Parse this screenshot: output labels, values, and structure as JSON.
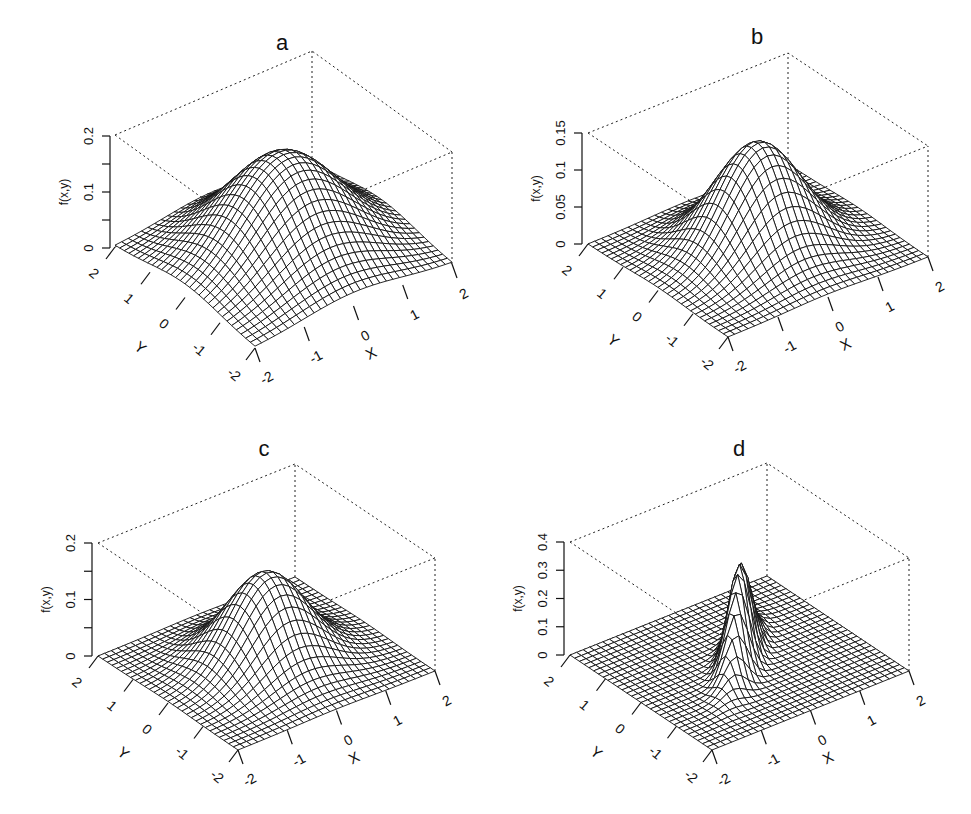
{
  "chart_data": [
    {
      "panel": "a",
      "type": "surface",
      "title": "a",
      "xlabel": "X",
      "ylabel": "Y",
      "zlabel": "f(x,y)",
      "xticks": [
        "-2",
        "-1",
        "0",
        "1",
        "2"
      ],
      "yticks": [
        "-2",
        "-1",
        "0",
        "1",
        "2"
      ],
      "zticks": [
        "0",
        "0.1",
        "0.2"
      ],
      "xlim": [
        -2,
        2
      ],
      "ylim": [
        -2,
        2
      ],
      "zlim": [
        0,
        0.2
      ],
      "surface": {
        "kind": "bivariate_normal",
        "mu": [
          0,
          0
        ],
        "sx": 1.0,
        "sy": 1.0,
        "rho": 0.0,
        "peak": 0.18
      },
      "grid": 30
    },
    {
      "panel": "b",
      "type": "surface",
      "title": "b",
      "xlabel": "X",
      "ylabel": "Y",
      "zlabel": "f(x,y)",
      "xticks": [
        "-2",
        "-1",
        "0",
        "1",
        "2"
      ],
      "yticks": [
        "-2",
        "-1",
        "0",
        "1",
        "2"
      ],
      "zticks": [
        "0",
        "0.05",
        "0.1",
        "0.15"
      ],
      "xlim": [
        -2,
        2
      ],
      "ylim": [
        -2,
        2
      ],
      "zlim": [
        0,
        0.15
      ],
      "surface": {
        "kind": "bivariate_normal",
        "mu": [
          0,
          0
        ],
        "sx": 0.75,
        "sy": 0.75,
        "rho": 0.0,
        "peak": 0.145
      },
      "grid": 30
    },
    {
      "panel": "c",
      "type": "surface",
      "title": "c",
      "xlabel": "X",
      "ylabel": "Y",
      "zlabel": "f(x,y)",
      "xticks": [
        "-2",
        "-1",
        "0",
        "1",
        "2"
      ],
      "yticks": [
        "-2",
        "-1",
        "0",
        "1",
        "2"
      ],
      "zticks": [
        "0",
        "0.1",
        "0.2"
      ],
      "xlim": [
        -2,
        2
      ],
      "ylim": [
        -2,
        2
      ],
      "zlim": [
        0,
        0.2
      ],
      "surface": {
        "kind": "bivariate_normal",
        "mu": [
          0,
          0
        ],
        "sx": 0.7,
        "sy": 0.7,
        "rho": 0.0,
        "peak": 0.16
      },
      "grid": 30
    },
    {
      "panel": "d",
      "type": "surface",
      "title": "d",
      "xlabel": "X",
      "ylabel": "Y",
      "zlabel": "f(x,y)",
      "xticks": [
        "-2",
        "-1",
        "0",
        "1",
        "2"
      ],
      "yticks": [
        "-2",
        "-1",
        "0",
        "1",
        "2"
      ],
      "zticks": [
        "0",
        "0.1",
        "0.2",
        "0.3",
        "0.4"
      ],
      "xlim": [
        -2,
        2
      ],
      "ylim": [
        -2,
        2
      ],
      "zlim": [
        0,
        0.4
      ],
      "surface": {
        "kind": "bivariate_normal",
        "mu": [
          0,
          0
        ],
        "sx": 0.45,
        "sy": 0.45,
        "rho": 0.85,
        "peak": 0.35
      },
      "grid": 30
    }
  ],
  "figure": {
    "panels": [
      {
        "title": "a",
        "zlabel": "f(x,y)",
        "xlabel": "X",
        "ylabel": "Y"
      },
      {
        "title": "b",
        "zlabel": "f(x,y)",
        "xlabel": "X",
        "ylabel": "Y"
      },
      {
        "title": "c",
        "zlabel": "f(x,y)",
        "xlabel": "X",
        "ylabel": "Y"
      },
      {
        "title": "d",
        "zlabel": "f(x,y)",
        "xlabel": "X",
        "ylabel": "Y"
      }
    ]
  }
}
